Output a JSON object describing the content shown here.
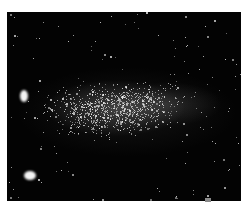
{
  "image": {
    "subject": "star field with dense irregular galaxy cloud",
    "background_color": "#ffffff",
    "sky_color": "#030303",
    "star_color": "#ffffff"
  },
  "features": {
    "bright_blobs": [
      {
        "name": "upper-left-bright-object",
        "x": 13,
        "y": 78,
        "w": 8,
        "h": 12
      },
      {
        "name": "lower-left-bright-object",
        "x": 17,
        "y": 159,
        "w": 12,
        "h": 9
      }
    ],
    "galaxy_core": {
      "cx": 108,
      "cy": 96,
      "rx": 70,
      "ry": 28
    },
    "star_counts": {
      "cloud": 900,
      "field": 140
    }
  }
}
